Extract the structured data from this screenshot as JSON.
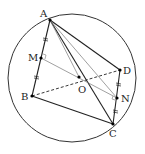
{
  "diagram": {
    "type": "geometry",
    "circle": {
      "cx": 72,
      "cy": 78,
      "r": 64,
      "color": "#333333"
    },
    "points": {
      "A": {
        "x": 50,
        "y": 20,
        "label": "A",
        "lx": 40,
        "ly": 17
      },
      "M": {
        "x": 41,
        "y": 58,
        "label": "M",
        "lx": 29,
        "ly": 61
      },
      "B": {
        "x": 32,
        "y": 96,
        "label": "B",
        "lx": 21,
        "ly": 100
      },
      "O": {
        "x": 79,
        "y": 77,
        "label": "O",
        "lx": 80,
        "ly": 93
      },
      "D": {
        "x": 120,
        "y": 70,
        "label": "D",
        "lx": 124,
        "ly": 74
      },
      "N": {
        "x": 117,
        "y": 98,
        "label": "N",
        "lx": 122,
        "ly": 102
      },
      "C": {
        "x": 113,
        "y": 124,
        "label": "C",
        "lx": 110,
        "ly": 137
      }
    },
    "labels": {
      "A": "A",
      "M": "M",
      "B": "B",
      "O": "O",
      "D": "D",
      "N": "N",
      "C": "C"
    },
    "segments_solid": [
      [
        "A",
        "B"
      ],
      [
        "B",
        "C"
      ],
      [
        "A",
        "C"
      ],
      [
        "A",
        "D"
      ],
      [
        "D",
        "C"
      ]
    ],
    "segments_thin": [
      [
        "A",
        "N"
      ],
      [
        "M",
        "N"
      ]
    ],
    "segments_dashed": [
      [
        "B",
        "D"
      ]
    ],
    "colors": {
      "stroke": "#222222",
      "thin_stroke": "#777777",
      "point": "#000000"
    }
  }
}
